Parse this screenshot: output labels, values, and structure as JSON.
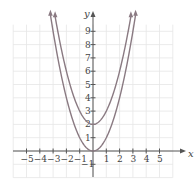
{
  "chart_data": {
    "type": "line",
    "title": "",
    "xlabel": "x",
    "ylabel": "y",
    "xlim": [
      -6,
      6
    ],
    "ylim": [
      -2,
      10
    ],
    "grid": true,
    "x_ticks": [
      -5,
      -4,
      -3,
      -2,
      -1,
      1,
      2,
      3,
      4,
      5
    ],
    "y_ticks": [
      -1,
      1,
      2,
      3,
      4,
      5,
      6,
      7,
      8,
      9
    ],
    "series": [
      {
        "name": "y = x^2",
        "x": [
          -3.2,
          -3,
          -2,
          -1,
          0,
          1,
          2,
          3,
          3.2
        ],
        "values": [
          10.24,
          9,
          4,
          1,
          0,
          1,
          4,
          9,
          10.24
        ]
      },
      {
        "name": "y = x^2 + 2",
        "x": [
          -2.85,
          -2,
          -1,
          0,
          1,
          2,
          2.85
        ],
        "values": [
          10.12,
          6,
          3,
          2,
          3,
          6,
          10.12
        ]
      }
    ],
    "colors": {
      "curve": "#8a7a82",
      "axis": "#555555",
      "grid": "#e6e6e6"
    }
  }
}
